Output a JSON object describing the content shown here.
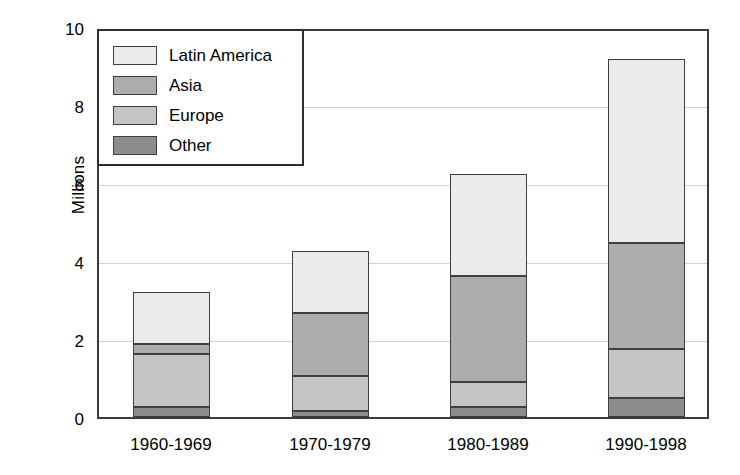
{
  "chart_data": {
    "type": "bar",
    "stacked": true,
    "title": "",
    "xlabel": "",
    "ylabel": "Millions",
    "ylim": [
      0,
      10
    ],
    "ytick_labels": [
      "10",
      "8",
      "6",
      "4",
      "2",
      "0"
    ],
    "ytick_values": [
      10,
      8,
      6,
      4,
      2,
      0
    ],
    "grid": "horizontal",
    "legend_position": "top-left",
    "categories": [
      "1960-1969",
      "1970-1979",
      "1980-1989",
      "1990-1998"
    ],
    "series": [
      {
        "name": "Latin America",
        "color": "#ebebeb",
        "values": [
          1.35,
          1.6,
          2.65,
          4.78
        ]
      },
      {
        "name": "Asia",
        "color": "#adadad",
        "values": [
          0.28,
          1.65,
          2.75,
          2.75
        ]
      },
      {
        "name": "Europe",
        "color": "#c4c4c4",
        "values": [
          1.35,
          0.9,
          0.65,
          1.25
        ]
      },
      {
        "name": "Other",
        "color": "#8c8c8c",
        "values": [
          0.27,
          0.15,
          0.25,
          0.5
        ]
      }
    ],
    "stack_order_bottom_to_top": [
      "Other",
      "Europe",
      "Asia",
      "Latin America"
    ],
    "totals": [
      3.25,
      4.3,
      6.3,
      9.28
    ],
    "axis_color": "#3a3a3a",
    "gridline_color": "#d2d2d2",
    "bar_edge_color": "#3f3f3f",
    "background": "#ffffff"
  },
  "legend": {
    "items": [
      {
        "label": "Latin America"
      },
      {
        "label": "Asia"
      },
      {
        "label": "Europe"
      },
      {
        "label": "Other"
      }
    ]
  }
}
